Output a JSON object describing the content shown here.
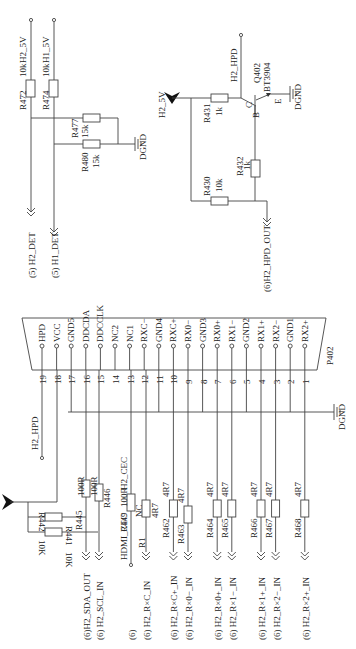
{
  "diagram": {
    "type": "circuit-schematic",
    "orientation": "rotated-90-ccw",
    "top_left": {
      "rails": [
        {
          "net": "H2_5V",
          "resistor": "R472",
          "value": "10k",
          "to": "(5) H2_DET"
        },
        {
          "net": "H1_5V",
          "resistor": "R474",
          "value": "10k",
          "to": "(5) H1_DET"
        }
      ],
      "pulldowns": [
        {
          "ref": "R477",
          "value": "15k"
        },
        {
          "ref": "R480",
          "value": "15k"
        }
      ],
      "ground": "DGND"
    },
    "top_right": {
      "supply": "H2_5V",
      "transistor": {
        "ref": "Q402",
        "part": "BT3904",
        "pins": {
          "c": "C",
          "b": "B",
          "e": "E"
        }
      },
      "output_net": "H2_HPD",
      "resistors": [
        {
          "ref": "R431",
          "value": "1k"
        },
        {
          "ref": "R432",
          "value": "1k"
        },
        {
          "ref": "R430",
          "value": "10k"
        }
      ],
      "input": "(6)H2_HPD_OUT",
      "ground": "DGND"
    },
    "connector": {
      "ref": "P402",
      "pins": [
        {
          "num": "19",
          "name": "HPD"
        },
        {
          "num": "18",
          "name": "VCC"
        },
        {
          "num": "17",
          "name": "GND5"
        },
        {
          "num": "16",
          "name": "DDCDA"
        },
        {
          "num": "15",
          "name": "DDCCLK"
        },
        {
          "num": "14",
          "name": "NC2"
        },
        {
          "num": "13",
          "name": "NC1"
        },
        {
          "num": "12",
          "name": "RXC−"
        },
        {
          "num": "11",
          "name": "GND4"
        },
        {
          "num": "10",
          "name": "RXC+"
        },
        {
          "num": "9",
          "name": "RX0−"
        },
        {
          "num": "8",
          "name": "GND3"
        },
        {
          "num": "7",
          "name": "RX0+"
        },
        {
          "num": "6",
          "name": "RX1−"
        },
        {
          "num": "5",
          "name": "GND2"
        },
        {
          "num": "4",
          "name": "RX1+"
        },
        {
          "num": "3",
          "name": "RX2−"
        },
        {
          "num": "2",
          "name": "GND1"
        },
        {
          "num": "1",
          "name": "RX2+"
        }
      ],
      "ground": "DGND"
    },
    "bottom": {
      "hpd_label": "H2_HPD",
      "cec_label": "H2_CEC",
      "pullups": [
        {
          "ref": "R442",
          "value": "10K"
        },
        {
          "ref": "R441",
          "value": "10K"
        }
      ],
      "series": [
        {
          "ref": "R445",
          "value": "100R",
          "net": "(6)H2_SDA_OUT"
        },
        {
          "ref": "R446",
          "value": "100R",
          "net": "(6) H2_SCL_IN"
        },
        {
          "ref": "R449",
          "value": "100R",
          "net": "HDMI_CEC",
          "prefix": "(6)"
        },
        {
          "ref": "R1",
          "value": "4R7",
          "extra": "NC",
          "net": "(6) H2_R×C_IN"
        },
        {
          "ref": "R462",
          "value": "4R7",
          "net": "(6) H2_R×C+_IN"
        },
        {
          "ref": "R463",
          "value": "4R7",
          "net": "(6) H2_R×0−_IN"
        },
        {
          "ref": "R464",
          "value": "4R7",
          "net": "(6) H2_R×0+_IN"
        },
        {
          "ref": "R465",
          "value": "4R7",
          "net": "(6) H2_R×1−_IN"
        },
        {
          "ref": "R466",
          "value": "4R7",
          "net": "(6) H2_R×1+_IN"
        },
        {
          "ref": "R467",
          "value": "4R7",
          "net": "(6) H2_R×2−_IN"
        },
        {
          "ref": "R468",
          "value": "4R7",
          "net": "(6) H2_R×2+_IN"
        }
      ]
    }
  },
  "labels": {
    "h2_5v": "H2_5V",
    "h1_5v": "H1_5V",
    "r472": "R472",
    "r472v": "10k",
    "r474": "R474",
    "r474v": "10k",
    "r477": "R477",
    "r477v": "15k",
    "r480": "R480",
    "r480v": "15k",
    "dgnd": "DGND",
    "h2det": "(5)  H2_DET",
    "h1det": "(5)  H1_DET",
    "h2_5v_b": "H2_5V",
    "h2hpd": "H2_HPD",
    "q402": "Q402",
    "bt3904": "BT3904",
    "c": "C",
    "b": "B",
    "e": "E",
    "r431": "R431",
    "r431v": "1k",
    "r432": "R432",
    "r432v": "1k",
    "r430": "R430",
    "r430v": "10k",
    "hpdout": "(6)H2_HPD_OUT",
    "p402": "P402",
    "h2hpd2": "H2_HPD",
    "h2cec": "H2_CEC",
    "r442": "R442",
    "r442v": "10K",
    "r441": "R441",
    "r441v": "10K",
    "r445": "R445",
    "r445v": "100R",
    "r446": "R446",
    "r446v": "100R",
    "r449": "R449",
    "r449v": "100R",
    "hdmicec": "HDMI_CEC",
    "nc": "NC",
    "r1": "R1",
    "r1v": "4R7",
    "p6": "(6)",
    "n_sda": "(6)H2_SDA_OUT",
    "n_scl": "(6) H2_SCL_IN",
    "n_rxc": "(6) H2_R×C_IN",
    "n_rxcp": "(6) H2_R×C+_IN",
    "n_rx0m": "(6) H2_R×0−_IN",
    "n_rx0p": "(6) H2_R×0+_IN",
    "n_rx1m": "(6) H2_R×1−_IN",
    "n_rx1p": "(6) H2_R×1+_IN",
    "n_rx2m": "(6) H2_R×2−_IN",
    "n_rx2p": "(6) H2_R×2+_IN",
    "r462": "R462",
    "r463": "R463",
    "r464": "R464",
    "r465": "R465",
    "r466": "R466",
    "r467": "R467",
    "r468": "R468",
    "v4r7": "4R7"
  }
}
